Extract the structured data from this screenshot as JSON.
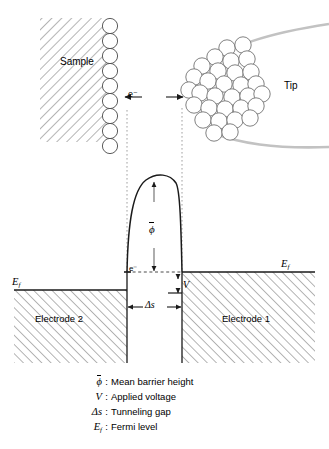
{
  "figure": {
    "title_present": false,
    "top_view": {
      "sample_label": "Sample",
      "tip_label": "Tip",
      "electron_label": "e⁻",
      "sample_atom_count": 9,
      "tip_atom_count": 31
    },
    "energy_diagram": {
      "electrode_left_label": "Electrode 2",
      "electrode_right_label": "Electrode 1",
      "fermi_left_label": "E",
      "fermi_left_sub": "f",
      "fermi_right_label": "E",
      "fermi_right_sub": "f",
      "electron_label": "e⁻",
      "barrier_label": "ϕ",
      "voltage_label": "V",
      "gap_label": "Δs"
    },
    "legend": [
      {
        "symbol": "ϕ",
        "symbol_overbar": true,
        "colon": ":",
        "description": "Mean barrier height"
      },
      {
        "symbol": "V",
        "symbol_overbar": false,
        "colon": ":",
        "description": "Applied voltage"
      },
      {
        "symbol": "Δs",
        "symbol_overbar": false,
        "colon": ":",
        "description": "Tunneling gap"
      },
      {
        "symbol": "E",
        "symbol_sub": "f",
        "symbol_overbar": false,
        "colon": ":",
        "description": "Fermi level"
      }
    ],
    "colors": {
      "stroke": "#1a1a1a",
      "hatch": "#808080",
      "guide": "#9a9a9a",
      "tip_outline": "#b8b8b8",
      "background": "#ffffff"
    }
  }
}
